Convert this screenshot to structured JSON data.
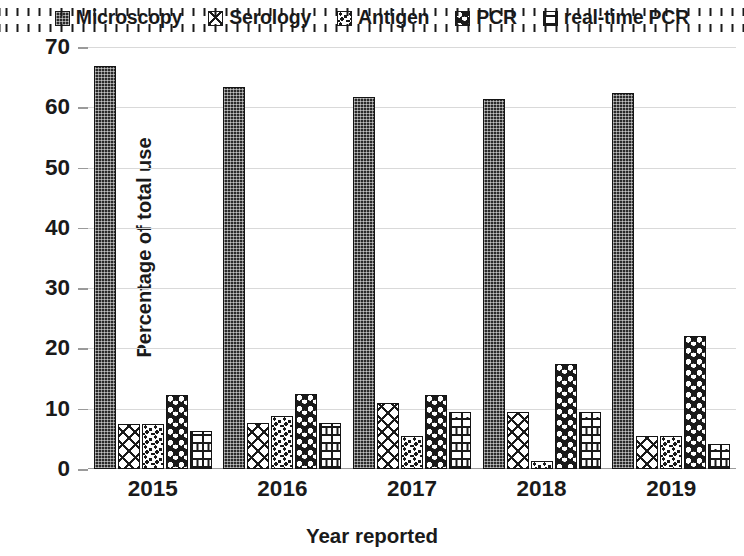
{
  "chart_data": {
    "type": "bar",
    "title": "",
    "xlabel": "Year reported",
    "ylabel": "Percentage of total use",
    "categories": [
      "2015",
      "2016",
      "2017",
      "2018",
      "2019"
    ],
    "ylim": [
      0,
      70
    ],
    "yticks": [
      0,
      10,
      20,
      30,
      40,
      50,
      60,
      70
    ],
    "ytick_labels": [
      "0",
      "10",
      "20",
      "30",
      "40",
      "50",
      "60",
      "70"
    ],
    "grid": true,
    "legend_position": "top",
    "series": [
      {
        "name": "Microscopy",
        "pattern": "dense-dark",
        "values": [
          66.8,
          63.4,
          61.7,
          61.4,
          62.3
        ]
      },
      {
        "name": "Serology",
        "pattern": "crosshatch",
        "values": [
          7.5,
          7.6,
          11.0,
          9.5,
          5.5
        ]
      },
      {
        "name": "Antigen",
        "pattern": "speckle",
        "values": [
          7.5,
          8.8,
          5.5,
          1.4,
          5.4
        ]
      },
      {
        "name": "PCR",
        "pattern": "dark-dots",
        "values": [
          12.3,
          12.5,
          12.3,
          17.5,
          22.0
        ]
      },
      {
        "name": "real-time PCR",
        "pattern": "brick",
        "values": [
          6.3,
          7.6,
          9.5,
          9.5,
          4.2
        ]
      }
    ]
  },
  "legend": {
    "items": [
      {
        "label": "Microscopy"
      },
      {
        "label": "Serology"
      },
      {
        "label": "Antigen"
      },
      {
        "label": "PCR"
      },
      {
        "label": "real-time PCR"
      }
    ]
  },
  "axes": {
    "y_title": "Percentage of total use",
    "x_title": "Year reported"
  },
  "colors": {
    "ink": "#1a1a1a",
    "grid": "#d9d9d9",
    "axis": "#9a9a9a",
    "background": "#ffffff"
  }
}
